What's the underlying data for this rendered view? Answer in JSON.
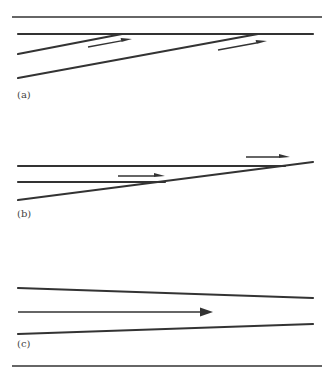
{
  "figure": {
    "width": 334,
    "height": 377,
    "line_color": "#333333",
    "panels": [
      {
        "label": "(a)",
        "label_pos": [
          17,
          98
        ],
        "lines": [
          {
            "x1": 18,
            "y1": 34,
            "x2": 313,
            "y2": 34,
            "w": 2.2
          },
          {
            "x1": 18,
            "y1": 54,
            "x2": 122,
            "y2": 34,
            "w": 2.2
          },
          {
            "x1": 18,
            "y1": 78,
            "x2": 258,
            "y2": 34,
            "w": 2.2
          }
        ],
        "arrows": [
          {
            "x1": 88,
            "y1": 47,
            "x2": 132,
            "y2": 39
          },
          {
            "x1": 218,
            "y1": 50,
            "x2": 267,
            "y2": 41
          }
        ]
      },
      {
        "label": "(b)",
        "label_pos": [
          17,
          217
        ],
        "lines": [
          {
            "x1": 18,
            "y1": 166,
            "x2": 285,
            "y2": 166,
            "w": 2.2
          },
          {
            "x1": 18,
            "y1": 182,
            "x2": 165,
            "y2": 182,
            "w": 2.2
          },
          {
            "x1": 18,
            "y1": 200,
            "x2": 313,
            "y2": 162,
            "w": 2.2
          }
        ],
        "arrows": [
          {
            "x1": 118,
            "y1": 176,
            "x2": 165,
            "y2": 176
          },
          {
            "x1": 246,
            "y1": 157,
            "x2": 290,
            "y2": 157
          }
        ]
      },
      {
        "label": "(c)",
        "label_pos": [
          17,
          347
        ],
        "lines": [
          {
            "x1": 18,
            "y1": 288,
            "x2": 313,
            "y2": 298,
            "w": 2.2
          },
          {
            "x1": 18,
            "y1": 334,
            "x2": 313,
            "y2": 324,
            "w": 2.2
          }
        ],
        "arrows": [
          {
            "x1": 18,
            "y1": 312,
            "x2": 213,
            "y2": 312,
            "big": true
          }
        ]
      }
    ],
    "rules": [
      {
        "x1": 12,
        "y1": 17,
        "x2": 322,
        "y2": 17
      },
      {
        "x1": 12,
        "y1": 366,
        "x2": 322,
        "y2": 366
      }
    ]
  }
}
